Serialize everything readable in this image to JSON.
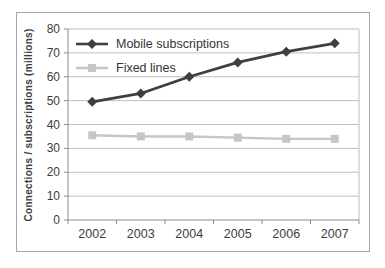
{
  "window": {
    "background": "#ffffff"
  },
  "colors": {
    "chart_border": "#a6a6a6",
    "plot_background": "#ffffff",
    "gridline": "#bdbdbd",
    "axis": "#8c8c8c",
    "tick_text": "#3d3d3d"
  },
  "chart_data": {
    "type": "line",
    "title": "",
    "ylabel": "Connections / subscriptions (millions)",
    "xlabel": "",
    "categories": [
      "2002",
      "2003",
      "2004",
      "2005",
      "2006",
      "2007"
    ],
    "series": [
      {
        "name": "Mobile subscriptions",
        "values": [
          49.5,
          53,
          60,
          66,
          70.5,
          74
        ],
        "color": "#3f3f3f",
        "marker": "diamond"
      },
      {
        "name": "Fixed lines",
        "values": [
          35.5,
          35,
          35,
          34.5,
          34,
          34
        ],
        "color": "#c6c6c6",
        "marker": "square"
      }
    ],
    "ylim": [
      0,
      80
    ],
    "yticks": [
      0,
      10,
      20,
      30,
      40,
      50,
      60,
      70,
      80
    ],
    "grid": "horizontal-only",
    "legend_position": "top-left-inside"
  }
}
